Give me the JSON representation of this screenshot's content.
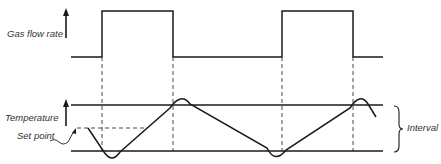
{
  "labels": {
    "gas_flow_rate": "Gas flow rate",
    "temperature": "Temperature",
    "set_point": "Set point",
    "interval": "Interval"
  },
  "colors": {
    "line": "#1a1a1a",
    "text": "#333333",
    "background": "#ffffff"
  },
  "diagram": {
    "gas_flow_wave": {
      "low_y": 57,
      "high_y": 11,
      "transitions_x": [
        102,
        173,
        282,
        353
      ],
      "start_x": 71,
      "end_x": 383
    },
    "temperature_band": {
      "upper_y": 105,
      "lower_y": 151,
      "set_point_y": 128
    }
  }
}
